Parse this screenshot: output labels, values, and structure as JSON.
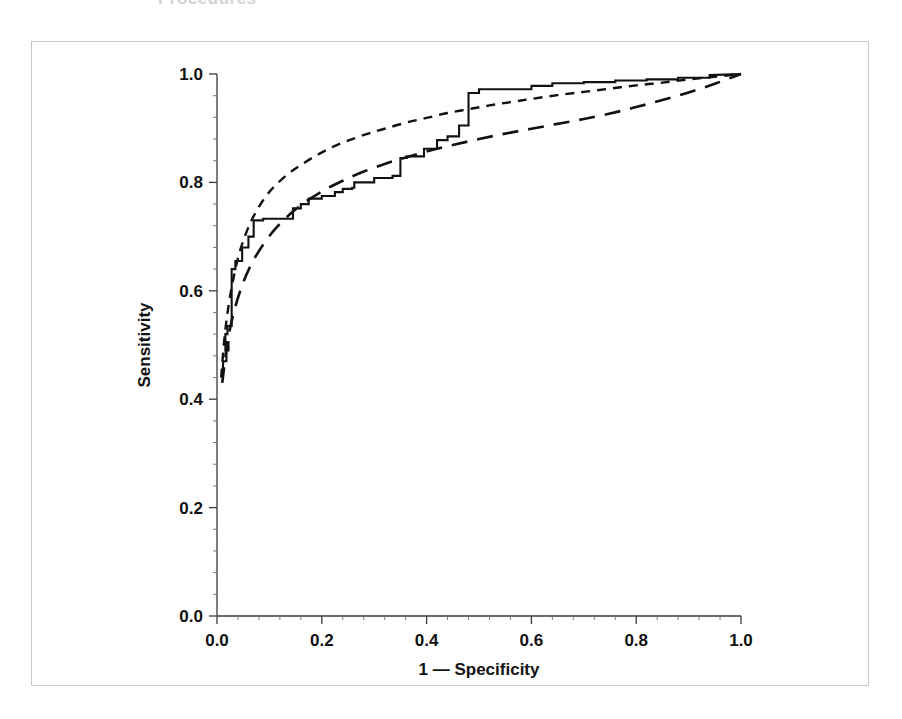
{
  "header": {
    "clipped_title": "Procedures"
  },
  "figure": {
    "frame_color": "#c8c8c8",
    "background": "#ffffff"
  },
  "chart_data": {
    "type": "line",
    "title": "",
    "subtitle": "",
    "xlabel": "1 — Specificity",
    "ylabel": "Sensitivity",
    "xlim": [
      0.0,
      1.0
    ],
    "ylim": [
      0.0,
      1.0
    ],
    "xticks": [
      "0.0",
      "0.2",
      "0.4",
      "0.6",
      "0.8",
      "1.0"
    ],
    "yticks": [
      "0.0",
      "0.2",
      "0.4",
      "0.6",
      "0.8",
      "1.0"
    ],
    "xtick_values": [
      0.0,
      0.2,
      0.4,
      0.6,
      0.8,
      1.0
    ],
    "ytick_values": [
      0.0,
      0.2,
      0.4,
      0.6,
      0.8,
      1.0
    ],
    "minor_ticks_per_interval": 4,
    "grid": false,
    "legend": "none",
    "legend_position": "none",
    "line_color": "#111111",
    "series": [
      {
        "name": "Empirical ROC curve",
        "style": "solid",
        "x": [
          0.01,
          0.012,
          0.018,
          0.018,
          0.022,
          0.022,
          0.016,
          0.016,
          0.02,
          0.02,
          0.028,
          0.028,
          0.035,
          0.035,
          0.048,
          0.048,
          0.06,
          0.06,
          0.07,
          0.07,
          0.088,
          0.088,
          0.145,
          0.145,
          0.16,
          0.16,
          0.175,
          0.175,
          0.2,
          0.2,
          0.225,
          0.225,
          0.24,
          0.24,
          0.258,
          0.258,
          0.262,
          0.262,
          0.3,
          0.3,
          0.335,
          0.335,
          0.35,
          0.35,
          0.362,
          0.362,
          0.395,
          0.395,
          0.42,
          0.42,
          0.44,
          0.44,
          0.462,
          0.462,
          0.48,
          0.48,
          0.5,
          0.5,
          0.6,
          0.6,
          0.64,
          0.64,
          0.7,
          0.7,
          0.76,
          0.76,
          0.82,
          0.82,
          0.88,
          0.88,
          0.94,
          0.94,
          1.0
        ],
        "y": [
          0.44,
          0.47,
          0.47,
          0.505,
          0.505,
          0.49,
          0.49,
          0.52,
          0.52,
          0.535,
          0.535,
          0.64,
          0.64,
          0.655,
          0.655,
          0.68,
          0.68,
          0.7,
          0.7,
          0.73,
          0.73,
          0.733,
          0.733,
          0.752,
          0.752,
          0.76,
          0.76,
          0.77,
          0.77,
          0.775,
          0.775,
          0.782,
          0.782,
          0.788,
          0.788,
          0.79,
          0.79,
          0.8,
          0.8,
          0.808,
          0.808,
          0.812,
          0.812,
          0.845,
          0.845,
          0.848,
          0.848,
          0.862,
          0.862,
          0.878,
          0.878,
          0.885,
          0.885,
          0.905,
          0.905,
          0.965,
          0.965,
          0.972,
          0.972,
          0.978,
          0.978,
          0.983,
          0.983,
          0.985,
          0.985,
          0.988,
          0.988,
          0.99,
          0.99,
          0.993,
          0.993,
          0.998,
          1.0
        ],
        "description": "stepped empirical ROC from observed data"
      },
      {
        "name": "Fitted ROC curve (upper)",
        "style": "dashed-short",
        "x": [
          0.008,
          0.015,
          0.025,
          0.04,
          0.055,
          0.07,
          0.09,
          0.11,
          0.135,
          0.16,
          0.19,
          0.22,
          0.25,
          0.285,
          0.32,
          0.36,
          0.4,
          0.44,
          0.48,
          0.52,
          0.56,
          0.6,
          0.65,
          0.7,
          0.75,
          0.8,
          0.85,
          0.9,
          0.95,
          1.0
        ],
        "y": [
          0.44,
          0.52,
          0.59,
          0.66,
          0.705,
          0.738,
          0.77,
          0.793,
          0.815,
          0.832,
          0.85,
          0.865,
          0.877,
          0.889,
          0.899,
          0.91,
          0.919,
          0.928,
          0.935,
          0.942,
          0.948,
          0.954,
          0.961,
          0.967,
          0.973,
          0.979,
          0.984,
          0.99,
          0.995,
          1.0
        ],
        "description": "smooth binormal fit lying above the empirical curve"
      },
      {
        "name": "Fitted ROC curve (lower)",
        "style": "dashed-long",
        "x": [
          0.01,
          0.02,
          0.032,
          0.048,
          0.066,
          0.088,
          0.112,
          0.14,
          0.17,
          0.205,
          0.24,
          0.28,
          0.32,
          0.36,
          0.4,
          0.45,
          0.5,
          0.55,
          0.6,
          0.65,
          0.7,
          0.75,
          0.8,
          0.85,
          0.9,
          0.95,
          1.0
        ],
        "y": [
          0.43,
          0.505,
          0.56,
          0.61,
          0.65,
          0.685,
          0.715,
          0.742,
          0.765,
          0.786,
          0.803,
          0.82,
          0.834,
          0.846,
          0.857,
          0.869,
          0.88,
          0.89,
          0.899,
          0.908,
          0.917,
          0.927,
          0.939,
          0.952,
          0.966,
          0.982,
          1.0
        ],
        "description": "smooth fit lying below the empirical curve at mid range"
      }
    ]
  }
}
